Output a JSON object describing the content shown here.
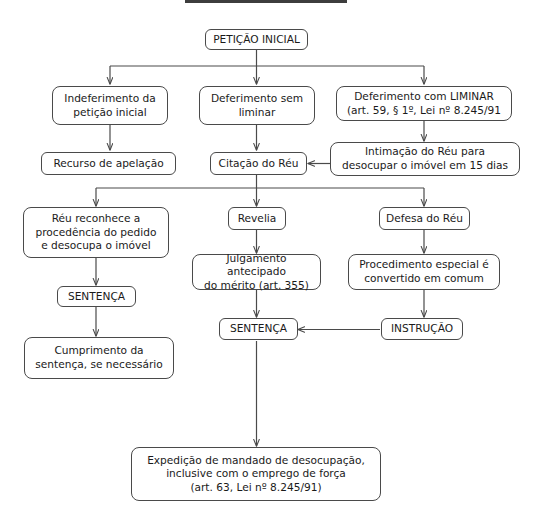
{
  "diagram": {
    "title": "",
    "background_color": "#ffffff",
    "border_color": "#4a4a4a",
    "text_color": "#1a1a1a",
    "nodes": [
      {
        "id": "peticao_inicial",
        "label": "PETIÇÃO INICIAL"
      },
      {
        "id": "indeferimento",
        "label": "Indeferimento da\npetição inicial"
      },
      {
        "id": "deferimento_sem",
        "label": "Deferimento sem\nliminar"
      },
      {
        "id": "deferimento_com",
        "label": "Deferimento com LIMINAR\n(art. 59, § 1º, Lei nº 8.245/91"
      },
      {
        "id": "recurso",
        "label": "Recurso de apelação"
      },
      {
        "id": "citacao",
        "label": "Citação do Réu"
      },
      {
        "id": "intimacao",
        "label": "Intimação do Réu para\ndesocupar o imóvel em 15 dias"
      },
      {
        "id": "reu_reconhece",
        "label": "Réu reconhece a\nprocedência do pedido\ne desocupa o imóvel"
      },
      {
        "id": "revelia",
        "label": "Revelia"
      },
      {
        "id": "defesa",
        "label": "Defesa do Réu"
      },
      {
        "id": "sentenca_esq",
        "label": "SENTENÇA"
      },
      {
        "id": "julgamento",
        "label": "Julgamento antecipado\ndo mérito (art. 355)"
      },
      {
        "id": "procedimento",
        "label": "Procedimento especial é\nconvertido em comum"
      },
      {
        "id": "cumprimento",
        "label": "Cumprimento da\nsentença, se necessário"
      },
      {
        "id": "sentenca_centro",
        "label": "SENTENÇA"
      },
      {
        "id": "instrucao",
        "label": "INSTRUÇÃO"
      },
      {
        "id": "expedicao",
        "label": "Expedição de mandado de desocupação,\ninclusive com o emprego de força\n(art. 63, Lei nº 8.245/91)"
      }
    ]
  }
}
